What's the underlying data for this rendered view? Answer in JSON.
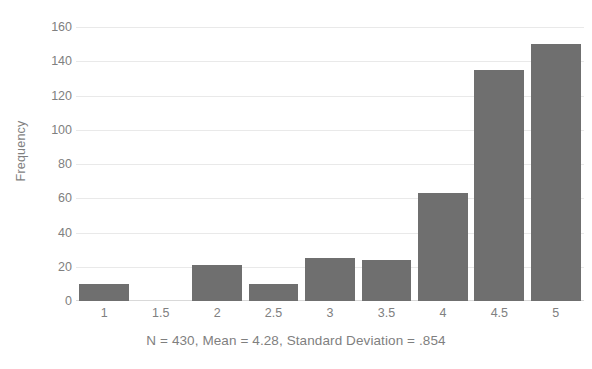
{
  "chart_data": {
    "type": "bar",
    "title": "",
    "subtitle": "",
    "xlabel": "N = 430, Mean = 4.28, Standard Deviation = .854",
    "ylabel": "Frequency",
    "categories": [
      "1",
      "1.5",
      "2",
      "2.5",
      "3",
      "3.5",
      "4",
      "4.5",
      "5"
    ],
    "values": [
      10,
      0,
      21,
      10,
      25,
      24,
      63,
      135,
      150
    ],
    "series": [
      {
        "name": "Frequency",
        "values": [
          10,
          0,
          21,
          10,
          25,
          24,
          63,
          135,
          150
        ]
      }
    ],
    "ylim": [
      0,
      160
    ],
    "ytick_step": 20,
    "yticks": [
      "160",
      "140",
      "120",
      "100",
      "80",
      "60",
      "40",
      "20",
      "0"
    ],
    "ytick_values": [
      160,
      140,
      120,
      100,
      80,
      60,
      40,
      20,
      0
    ],
    "grid": true,
    "grid_axis": "y",
    "legend": false,
    "legend_position": "none",
    "bar_color": "#6f6f6f",
    "grid_color": "#e9e9e9",
    "tick_label_color": "#808080",
    "axis_title_color": "#7f7f7f",
    "background_color": "#ffffff",
    "annotations": [
      {
        "name": "summary-statistics",
        "text": "N = 430, Mean = 4.28, Standard Deviation = .854"
      }
    ]
  }
}
